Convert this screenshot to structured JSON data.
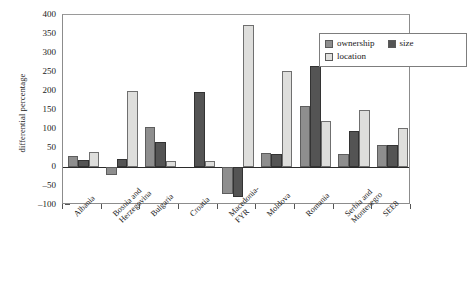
{
  "chart_data": {
    "type": "bar",
    "title": "",
    "xlabel": "",
    "ylabel": "differential percentage",
    "ylim": [
      -100,
      400
    ],
    "ytick_step": 50,
    "ytick_labels": [
      "400",
      "350",
      "300",
      "250",
      "200",
      "150",
      "100",
      "50",
      "0",
      "-50",
      "-100"
    ],
    "grid": false,
    "legend_position": "top-right",
    "categories": [
      "Albania",
      "Bosnia and\nHerzegovina",
      "Bulgaria",
      "Croatia",
      "Macedonia-\nFYR",
      "Moldova",
      "Romania",
      "Serbia and\nMontenegro",
      "SEE8"
    ],
    "series": [
      {
        "name": "ownership",
        "color": "#8e8e8e",
        "values": [
          30,
          -20,
          105,
          0,
          -70,
          38,
          160,
          35,
          58
        ]
      },
      {
        "name": "size",
        "color": "#545454",
        "values": [
          18,
          20,
          65,
          197,
          -80,
          35,
          265,
          95,
          58
        ]
      },
      {
        "name": "location",
        "color": "#dededc",
        "values": [
          40,
          200,
          15,
          15,
          375,
          253,
          120,
          150,
          103
        ]
      }
    ]
  },
  "legend": {
    "items": [
      {
        "label": "ownership",
        "key": "ownership"
      },
      {
        "label": "size",
        "key": "size"
      },
      {
        "label": "location",
        "key": "location"
      }
    ]
  },
  "axis": {
    "y_title": "differential percentage"
  }
}
